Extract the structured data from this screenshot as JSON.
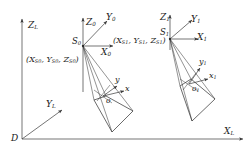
{
  "diagram": {
    "type": "photogrammetry-coordinate-frames",
    "stroke_color": "#3a3a3a",
    "text_color": "#1a1a1a",
    "background": "#ffffff"
  },
  "global_frame": {
    "origin_label": "D",
    "z_axis_label": "Z",
    "z_axis_sub": "L",
    "y_axis_label": "Y",
    "y_axis_sub": "L",
    "x_axis_label": "X",
    "x_axis_sub": "L"
  },
  "station0": {
    "point_label": "S",
    "point_sub": "0",
    "z_axis_label": "Z",
    "z_axis_sub": "0",
    "y_axis_label": "Y",
    "y_axis_sub": "0",
    "x_axis_label": "X",
    "x_axis_sub": "0",
    "coordinates_text": "(X",
    "coordinates_full": "(XS0, YS0, ZS0)",
    "coord_parts": {
      "open": "(",
      "x": "X",
      "x_sub": "S",
      "x_sub2": "0",
      "y": "Y",
      "y_sub": "S",
      "y_sub2": "0",
      "z": "Z",
      "z_sub": "S",
      "z_sub2": "0",
      "close": ")",
      "sep": ", "
    },
    "image_frame": {
      "origin_label": "o",
      "origin_sub": "",
      "x_axis_label": "x",
      "x_axis_sub": "",
      "y_axis_label": "y",
      "y_axis_sub": ""
    }
  },
  "station1": {
    "point_label": "S",
    "point_sub": "1",
    "z_axis_label": "Z",
    "z_axis_sub": "1",
    "y_axis_label": "Y",
    "y_axis_sub": "1",
    "x_axis_label": "X",
    "x_axis_sub": "1",
    "coordinates_full": "(XS1, YS1, ZS1)",
    "coord_parts": {
      "open": "(",
      "x": "X",
      "x_sub": "S",
      "x_sub2": "1",
      "y": "Y",
      "y_sub": "S",
      "y_sub2": "1",
      "z": "Z",
      "z_sub": "S",
      "z_sub2": "1",
      "close": ")",
      "sep": ", "
    },
    "image_frame": {
      "origin_label": "o",
      "origin_sub": "1",
      "x_axis_label": "x",
      "x_axis_sub": "1",
      "y_axis_label": "y",
      "y_axis_sub": "1"
    }
  }
}
